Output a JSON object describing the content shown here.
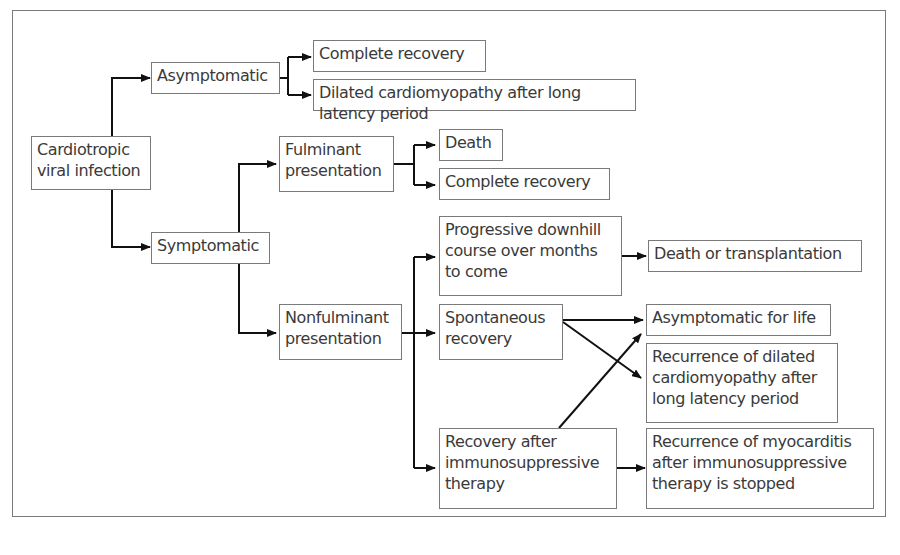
{
  "diagram": {
    "type": "flowchart",
    "nodes": {
      "root": "Cardiotropic\nviral infection",
      "asymptomatic": "Asymptomatic",
      "asym_complete_recovery": "Complete recovery",
      "asym_dcm": "Dilated cardiomyopathy after long latency period",
      "symptomatic": "Symptomatic",
      "fulminant": "Fulminant\npresentation",
      "ful_death": "Death",
      "ful_complete_recovery": "Complete recovery",
      "nonfulminant": "Nonfulminant\npresentation",
      "progressive": "Progressive downhill\ncourse over months\nto come",
      "death_transplant": "Death or transplantation",
      "spontaneous": "Spontaneous\nrecovery",
      "asym_for_life": "Asymptomatic for life",
      "recurrence_dcm": "Recurrence of dilated\ncardiomyopathy after\nlong latency period",
      "recovery_immuno": "Recovery after\nimmunosuppressive\ntherapy",
      "recurrence_myocarditis": "Recurrence of myocarditis\nafter immunosuppressive\ntherapy is stopped"
    },
    "edges": [
      [
        "root",
        "asymptomatic"
      ],
      [
        "root",
        "symptomatic"
      ],
      [
        "asymptomatic",
        "asym_complete_recovery"
      ],
      [
        "asymptomatic",
        "asym_dcm"
      ],
      [
        "symptomatic",
        "fulminant"
      ],
      [
        "symptomatic",
        "nonfulminant"
      ],
      [
        "fulminant",
        "ful_death"
      ],
      [
        "fulminant",
        "ful_complete_recovery"
      ],
      [
        "nonfulminant",
        "progressive"
      ],
      [
        "nonfulminant",
        "spontaneous"
      ],
      [
        "nonfulminant",
        "recovery_immuno"
      ],
      [
        "progressive",
        "death_transplant"
      ],
      [
        "spontaneous",
        "asym_for_life"
      ],
      [
        "spontaneous",
        "recurrence_dcm"
      ],
      [
        "recovery_immuno",
        "asym_for_life"
      ],
      [
        "recovery_immuno",
        "recurrence_myocarditis"
      ]
    ]
  }
}
